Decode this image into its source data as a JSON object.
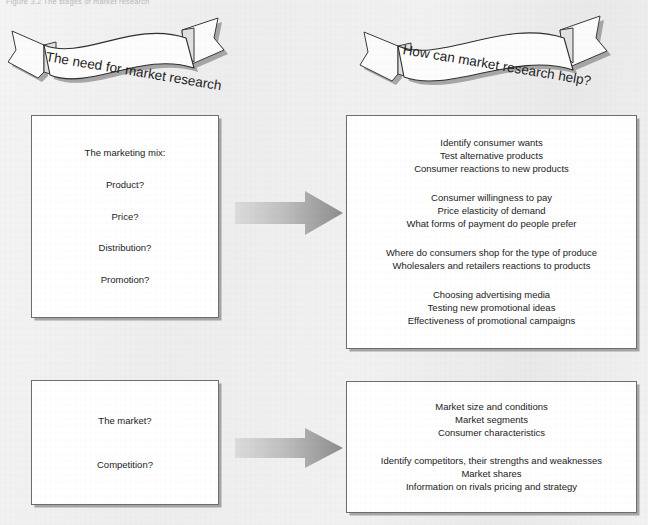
{
  "figure": {
    "caption": "Figure 3.2  The stages of market research"
  },
  "banners": {
    "left": {
      "label": "The need for market research",
      "name": "banner-need-for-market-research"
    },
    "right": {
      "label": "How can market research help?",
      "name": "banner-how-can-market-research-help"
    }
  },
  "boxes": {
    "marketing_mix": {
      "title": "The marketing mix:",
      "items": [
        "Product?",
        "Price?",
        "Distribution?",
        "Promotion?"
      ]
    },
    "market_research_help": {
      "groups": [
        [
          "Identify consumer wants",
          "Test alternative products",
          "Consumer reactions to new products"
        ],
        [
          "Consumer willingness to pay",
          "Price elasticity of demand",
          "What forms of payment do people prefer"
        ],
        [
          "Where do consumers shop for the type of produce",
          "Wholesalers and retailers reactions to products"
        ],
        [
          "Choosing advertising media",
          "Testing new promotional ideas",
          "Effectiveness of promotional campaigns"
        ]
      ]
    },
    "market_and_competition": {
      "items": [
        "The market?",
        "Competition?"
      ]
    },
    "market_answers": {
      "groups": [
        [
          "Market size and conditions",
          "Market segments",
          "Consumer characteristics"
        ],
        [
          "Identify competitors, their strengths and weaknesses",
          "Market shares",
          "Information on rivals pricing and strategy"
        ]
      ]
    }
  },
  "arrows": {
    "top": {
      "name": "arrow-mix-to-help",
      "direction": "right"
    },
    "bottom": {
      "name": "arrow-market-to-answers",
      "direction": "right"
    }
  },
  "colors": {
    "page_background": "#efefef",
    "box_fill": "#ffffff",
    "box_border": "#6d6d6d",
    "box_shadow": "#7c7c7c",
    "text": "#1b1b1b",
    "caption_text": "#b9b9b9",
    "arrow_light": "#d5d5d5",
    "arrow_dark": "#8f8f8f",
    "banner_fill": "#fdfdfd",
    "banner_stroke": "#3a3a3a",
    "banner_shadow": "#9a9a9a"
  }
}
